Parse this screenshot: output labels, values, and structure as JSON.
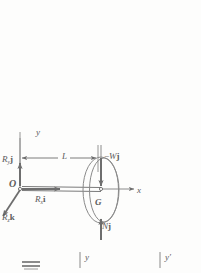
{
  "figure": {
    "type": "free-body-diagram",
    "stroke_color": "#6e6e6e",
    "label_color": "#5b5b5b",
    "background_color": "#fdfdfc"
  },
  "labels": {
    "y_axis": "y",
    "x_axis": "x",
    "origin": "O",
    "center_of_gravity": "G",
    "dimension_L": "L",
    "reaction_y": {
      "symbol": "R",
      "subscript": "y",
      "unit_vector": "j"
    },
    "reaction_x": {
      "symbol": "R",
      "subscript": "x",
      "unit_vector": "i"
    },
    "reaction_z": {
      "symbol": "R",
      "subscript": "z",
      "unit_vector": "k"
    },
    "weight": {
      "sign": "−",
      "symbol": "W",
      "unit_vector": "j"
    },
    "normal_force": {
      "symbol": "N",
      "unit_vector": "j"
    },
    "bottom_y": "y",
    "bottom_y_prime": "y′"
  },
  "geometry": {
    "origin_px": {
      "x": 20,
      "y": 188
    },
    "wheel_center_px": {
      "x": 101,
      "y": 190
    },
    "wheel_outer_rx": 18,
    "wheel_outer_ry": 33,
    "wheel_inner_rx": 14,
    "wheel_inner_ry": 32,
    "dimension_L_px": 78
  }
}
